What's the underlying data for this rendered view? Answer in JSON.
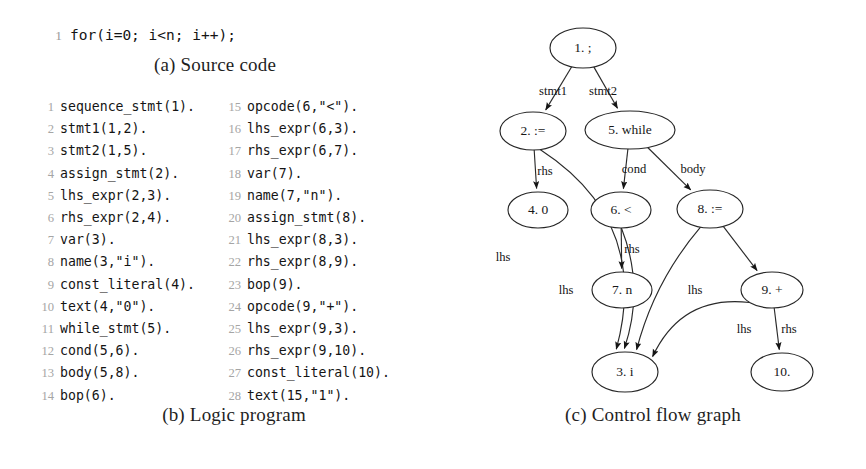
{
  "figure": {
    "panel_a": {
      "caption": "(a) Source code",
      "lines": [
        {
          "no": "1",
          "text": "for(i=0; i<n; i++);"
        }
      ]
    },
    "panel_b": {
      "caption": "(b) Logic program",
      "column_left": [
        {
          "no": "1",
          "text": "sequence_stmt(1)."
        },
        {
          "no": "2",
          "text": "stmt1(1,2)."
        },
        {
          "no": "3",
          "text": "stmt2(1,5)."
        },
        {
          "no": "4",
          "text": "assign_stmt(2)."
        },
        {
          "no": "5",
          "text": "lhs_expr(2,3)."
        },
        {
          "no": "6",
          "text": "rhs_expr(2,4)."
        },
        {
          "no": "7",
          "text": "var(3)."
        },
        {
          "no": "8",
          "text": "name(3,\"i\")."
        },
        {
          "no": "9",
          "text": "const_literal(4)."
        },
        {
          "no": "10",
          "text": "text(4,\"0\")."
        },
        {
          "no": "11",
          "text": "while_stmt(5)."
        },
        {
          "no": "12",
          "text": "cond(5,6)."
        },
        {
          "no": "13",
          "text": "body(5,8)."
        },
        {
          "no": "14",
          "text": "bop(6)."
        }
      ],
      "column_right": [
        {
          "no": "15",
          "text": "opcode(6,\"<\")."
        },
        {
          "no": "16",
          "text": "lhs_expr(6,3)."
        },
        {
          "no": "17",
          "text": "rhs_expr(6,7)."
        },
        {
          "no": "18",
          "text": "var(7)."
        },
        {
          "no": "19",
          "text": "name(7,\"n\")."
        },
        {
          "no": "20",
          "text": "assign_stmt(8)."
        },
        {
          "no": "21",
          "text": "lhs_expr(8,3)."
        },
        {
          "no": "22",
          "text": "rhs_expr(8,9)."
        },
        {
          "no": "23",
          "text": "bop(9)."
        },
        {
          "no": "24",
          "text": "opcode(9,\"+\")."
        },
        {
          "no": "25",
          "text": "lhs_expr(9,3)."
        },
        {
          "no": "26",
          "text": "rhs_expr(9,10)."
        },
        {
          "no": "27",
          "text": "const_literal(10)."
        },
        {
          "no": "28",
          "text": "text(15,\"1\")."
        }
      ]
    },
    "panel_c": {
      "caption": "(c) Control flow graph",
      "nodes": [
        {
          "id": "n1",
          "label": "1. ;",
          "cx": 143,
          "cy": 48,
          "rx": 33,
          "ry": 20
        },
        {
          "id": "n2",
          "label": "2. :=",
          "cx": 93,
          "cy": 131,
          "rx": 33,
          "ry": 19
        },
        {
          "id": "n5",
          "label": "5. while",
          "cx": 190,
          "cy": 130,
          "rx": 45,
          "ry": 19
        },
        {
          "id": "n4",
          "label": "4. 0",
          "cx": 98,
          "cy": 210,
          "rx": 30,
          "ry": 18
        },
        {
          "id": "n6",
          "label": "6. <",
          "cx": 181,
          "cy": 210,
          "rx": 30,
          "ry": 18
        },
        {
          "id": "n8",
          "label": "8. :=",
          "cx": 270,
          "cy": 209,
          "rx": 33,
          "ry": 19
        },
        {
          "id": "n7",
          "label": "7. n",
          "cx": 182,
          "cy": 290,
          "rx": 30,
          "ry": 18
        },
        {
          "id": "n9",
          "label": "9. +",
          "cx": 332,
          "cy": 290,
          "rx": 31,
          "ry": 18
        },
        {
          "id": "n3",
          "label": "3. i",
          "cx": 185,
          "cy": 372,
          "rx": 33,
          "ry": 20
        },
        {
          "id": "n10",
          "label": "10.",
          "cx": 342,
          "cy": 372,
          "rx": 31,
          "ry": 19
        }
      ],
      "edges": [
        {
          "from": "n1",
          "to": "n2",
          "label": "stmt1"
        },
        {
          "from": "n1",
          "to": "n5",
          "label": "stmt2"
        },
        {
          "from": "n2",
          "to": "n4",
          "label": "rhs"
        },
        {
          "from": "n2",
          "to": "n3",
          "label": "lhs"
        },
        {
          "from": "n5",
          "to": "n6",
          "label": "cond"
        },
        {
          "from": "n5",
          "to": "n8",
          "label": "body"
        },
        {
          "from": "n6",
          "to": "n7",
          "label": "rhs"
        },
        {
          "from": "n6",
          "to": "n3",
          "label": "lhs"
        },
        {
          "from": "n8",
          "to": "n9",
          "label": "rhs"
        },
        {
          "from": "n8",
          "to": "n3",
          "label": "lhs"
        },
        {
          "from": "n9",
          "to": "n10",
          "label": "rhs"
        },
        {
          "from": "n9",
          "to": "n3",
          "label": "lhs"
        }
      ],
      "edge_labels_positions": [
        {
          "label": "stmt1",
          "x": 113,
          "y": 92
        },
        {
          "label": "stmt2",
          "x": 163,
          "y": 92
        },
        {
          "label": "rhs",
          "x": 105,
          "y": 172
        },
        {
          "label": "cond",
          "x": 194,
          "y": 170
        },
        {
          "label": "body",
          "x": 253,
          "y": 170
        },
        {
          "label": "lhs",
          "x": 63,
          "y": 258
        },
        {
          "label": "rhs",
          "x": 192,
          "y": 250
        },
        {
          "label": "lhs",
          "x": 126,
          "y": 291
        },
        {
          "label": "lhs",
          "x": 255,
          "y": 291
        },
        {
          "label": "rhs",
          "x": 349,
          "y": 330
        },
        {
          "label": "lhs",
          "x": 304,
          "y": 330
        }
      ]
    }
  }
}
